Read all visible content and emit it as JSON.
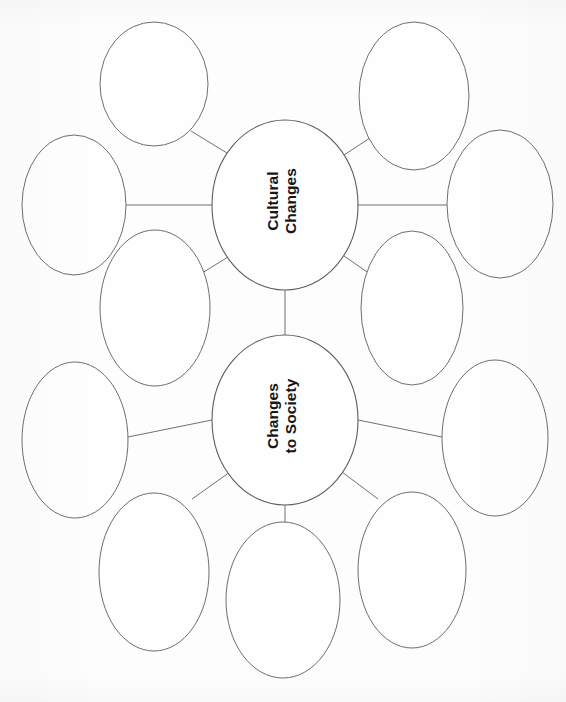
{
  "document": {
    "type": "graphic-organizer",
    "title": "Concept Web Worksheet",
    "background_color": "#fdfdfd",
    "outline_color": "#6e6e72",
    "text_color": "#161618"
  },
  "diagram": {
    "orientation": "rotated-90-ccw-labels",
    "center_nodes": [
      {
        "id": "cultural-changes",
        "label": "Cultural\nChanges",
        "cx": 285,
        "cy": 205,
        "rx": 73,
        "ry": 85,
        "satellite_count": 6
      },
      {
        "id": "changes-to-society",
        "label": "Changes\nto Society",
        "cx": 285,
        "cy": 420,
        "rx": 73,
        "ry": 85,
        "satellite_count": 6
      }
    ],
    "satellite_nodes": [
      {
        "id": "cc-sat-top-left",
        "parent": "cultural-changes",
        "cx": 154,
        "cy": 84,
        "rx": 54,
        "ry": 62,
        "label": ""
      },
      {
        "id": "cc-sat-top-right",
        "parent": "cultural-changes",
        "cx": 414,
        "cy": 96,
        "rx": 55,
        "ry": 74,
        "label": ""
      },
      {
        "id": "cc-sat-left",
        "parent": "cultural-changes",
        "cx": 74,
        "cy": 205,
        "rx": 52,
        "ry": 70,
        "label": ""
      },
      {
        "id": "cc-sat-right",
        "parent": "cultural-changes",
        "cx": 500,
        "cy": 204,
        "rx": 53,
        "ry": 74,
        "label": ""
      },
      {
        "id": "cc-sat-bottom-left",
        "parent": "cultural-changes",
        "cx": 155,
        "cy": 308,
        "rx": 55,
        "ry": 78,
        "label": ""
      },
      {
        "id": "cc-sat-bottom-right",
        "parent": "cultural-changes",
        "cx": 412,
        "cy": 308,
        "rx": 51,
        "ry": 77,
        "label": ""
      },
      {
        "id": "cs-sat-left",
        "parent": "changes-to-society",
        "cx": 75,
        "cy": 440,
        "rx": 53,
        "ry": 78,
        "label": ""
      },
      {
        "id": "cs-sat-right",
        "parent": "changes-to-society",
        "cx": 495,
        "cy": 438,
        "rx": 53,
        "ry": 78,
        "label": ""
      },
      {
        "id": "cs-sat-bottom-left",
        "parent": "changes-to-society",
        "cx": 154,
        "cy": 572,
        "rx": 55,
        "ry": 79,
        "label": ""
      },
      {
        "id": "cs-sat-bottom-center",
        "parent": "changes-to-society",
        "cx": 283,
        "cy": 600,
        "rx": 57,
        "ry": 78,
        "label": ""
      },
      {
        "id": "cs-sat-bottom-right",
        "parent": "changes-to-society",
        "cx": 412,
        "cy": 570,
        "rx": 54,
        "ry": 78,
        "label": ""
      },
      {
        "id": "cs-sat-top-left",
        "parent": "changes-to-society",
        "cx": 155,
        "cy": 308,
        "rx": 55,
        "ry": 78,
        "label": ""
      }
    ],
    "connectors": [
      {
        "from": "cultural-changes",
        "to": "cc-sat-top-left",
        "x1": 227,
        "y1": 153,
        "x2": 191,
        "y2": 131
      },
      {
        "from": "cultural-changes",
        "to": "cc-sat-top-right",
        "x1": 344,
        "y1": 155,
        "x2": 376,
        "y2": 134
      },
      {
        "from": "cultural-changes",
        "to": "cc-sat-left",
        "x1": 212,
        "y1": 205,
        "x2": 126,
        "y2": 205
      },
      {
        "from": "cultural-changes",
        "to": "cc-sat-right",
        "x1": 358,
        "y1": 205,
        "x2": 447,
        "y2": 205
      },
      {
        "from": "cultural-changes",
        "to": "cc-sat-bottom-left",
        "x1": 228,
        "y1": 257,
        "x2": 194,
        "y2": 278
      },
      {
        "from": "cultural-changes",
        "to": "cc-sat-bottom-right",
        "x1": 344,
        "y1": 256,
        "x2": 376,
        "y2": 278
      },
      {
        "from": "cultural-changes",
        "to": "changes-to-society",
        "x1": 285,
        "y1": 290,
        "x2": 285,
        "y2": 335
      },
      {
        "from": "changes-to-society",
        "to": "cs-sat-left",
        "x1": 212,
        "y1": 420,
        "x2": 128,
        "y2": 436
      },
      {
        "from": "changes-to-society",
        "to": "cs-sat-right",
        "x1": 358,
        "y1": 420,
        "x2": 442,
        "y2": 436
      },
      {
        "from": "changes-to-society",
        "to": "cs-sat-bottom-left",
        "x1": 230,
        "y1": 472,
        "x2": 192,
        "y2": 498
      },
      {
        "from": "changes-to-society",
        "to": "cs-sat-bottom-center",
        "x1": 285,
        "y1": 505,
        "x2": 285,
        "y2": 524
      },
      {
        "from": "changes-to-society",
        "to": "cs-sat-bottom-right",
        "x1": 342,
        "y1": 472,
        "x2": 378,
        "y2": 498
      }
    ]
  }
}
